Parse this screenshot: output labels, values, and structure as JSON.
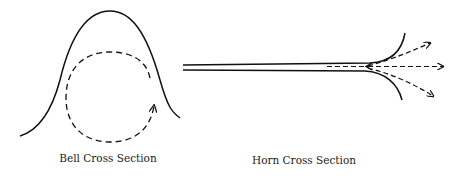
{
  "diagram": {
    "bell": {
      "label": "Bell Cross Section",
      "description": "Bell-shaped curve with circular dashed arrow inside"
    },
    "horn": {
      "label": "Horn Cross Section",
      "description": "Narrow tube flaring at the right end with dashed arrows radiating outward"
    },
    "colors": {
      "stroke": "#111111",
      "background": "#ffffff",
      "text": "#222222"
    }
  }
}
